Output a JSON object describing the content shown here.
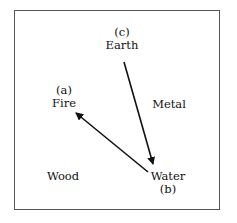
{
  "diagram": {
    "nodes": {
      "earth": {
        "label": "Earth",
        "tag": "(c)"
      },
      "fire": {
        "label": "Fire",
        "tag": "(a)"
      },
      "metal": {
        "label": "Metal"
      },
      "wood": {
        "label": "Wood"
      },
      "water": {
        "label": "Water",
        "tag": "(b)"
      }
    },
    "edges": [
      {
        "from": "Earth",
        "to": "Water"
      },
      {
        "from": "Water",
        "to": "Fire"
      }
    ],
    "colors": {
      "line": "#111111",
      "frame": "#555555"
    }
  }
}
